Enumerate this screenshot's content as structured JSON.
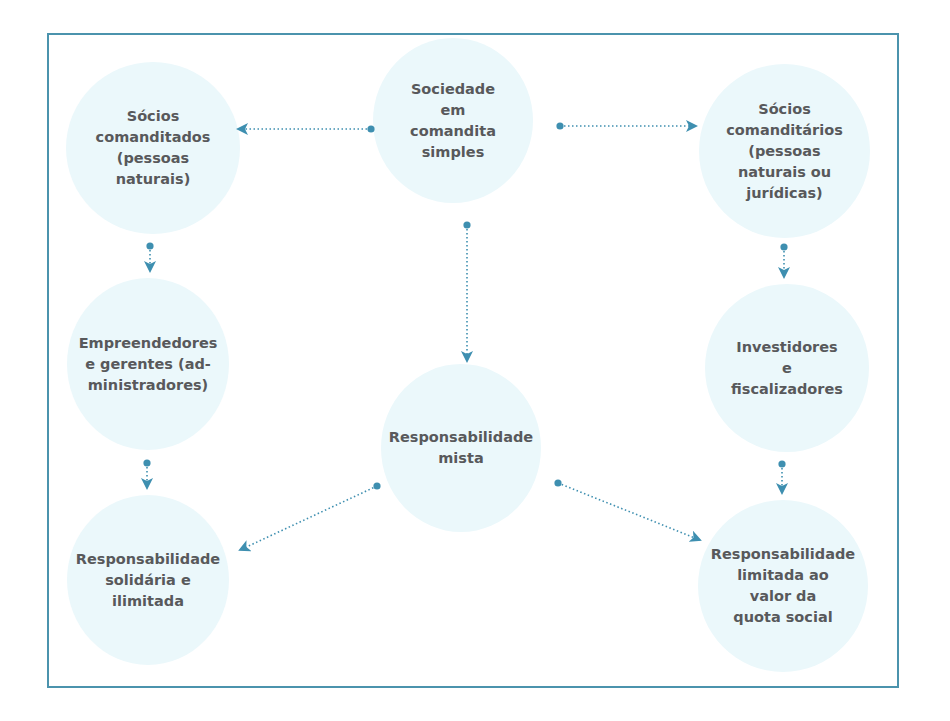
{
  "diagram": {
    "colors": {
      "frame": "#4b93ad",
      "node_fill": "#ebf8fb",
      "arrow": "#3e8fb0",
      "text": "#58595b"
    },
    "nodes": [
      {
        "id": "sociedade",
        "label": "Sociedade\nem\ncomandita\nsimples"
      },
      {
        "id": "comanditados",
        "label": "Sócios\ncomanditados\n(pessoas\nnaturais)"
      },
      {
        "id": "comanditarios",
        "label": "Sócios\ncomanditários\n(pessoas\nnaturais ou\njurídicas)"
      },
      {
        "id": "empreendedores",
        "label": "Empreendedores\ne gerentes (ad-\nministradores)"
      },
      {
        "id": "mista",
        "label": "Responsabilidade\nmista"
      },
      {
        "id": "investidores",
        "label": "Investidores\ne\nfiscalizadores"
      },
      {
        "id": "solidaria",
        "label": "Responsabilidade\nsolidária e\nilimitada"
      },
      {
        "id": "limitada",
        "label": "Responsabilidade\nlimitada ao\nvalor da\nquota social"
      }
    ],
    "edges": [
      {
        "from": "sociedade",
        "to": "comanditados"
      },
      {
        "from": "sociedade",
        "to": "comanditarios"
      },
      {
        "from": "sociedade",
        "to": "mista"
      },
      {
        "from": "comanditados",
        "to": "empreendedores"
      },
      {
        "from": "comanditarios",
        "to": "investidores"
      },
      {
        "from": "empreendedores",
        "to": "solidaria"
      },
      {
        "from": "investidores",
        "to": "limitada"
      },
      {
        "from": "mista",
        "to": "solidaria"
      },
      {
        "from": "mista",
        "to": "limitada"
      }
    ]
  }
}
